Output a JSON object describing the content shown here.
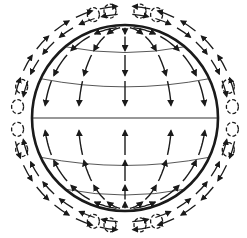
{
  "diagram": {
    "title": "",
    "colors": {
      "background": "#ffffff",
      "ink": "#1a1a1a",
      "thin_line": "#444444"
    },
    "latitude_lines_deg": [
      -50,
      -25,
      0,
      25,
      50
    ],
    "meridian_flows": [
      {
        "hemisphere": "north",
        "direction": "pole-to-equator",
        "longitudes_deg": [
          -60,
          -30,
          0,
          30,
          60
        ]
      },
      {
        "hemisphere": "south",
        "direction": "pole-to-equator",
        "longitudes_deg": [
          -60,
          -30,
          0,
          30,
          60
        ]
      }
    ],
    "outer_circulation": [
      {
        "quadrant": "north-west",
        "direction": "equator-to-pole",
        "cells": 4
      },
      {
        "quadrant": "north-east",
        "direction": "equator-to-pole",
        "cells": 4
      },
      {
        "quadrant": "south-west",
        "direction": "equator-to-pole",
        "cells": 4
      },
      {
        "quadrant": "south-east",
        "direction": "equator-to-pole",
        "cells": 4
      }
    ]
  }
}
